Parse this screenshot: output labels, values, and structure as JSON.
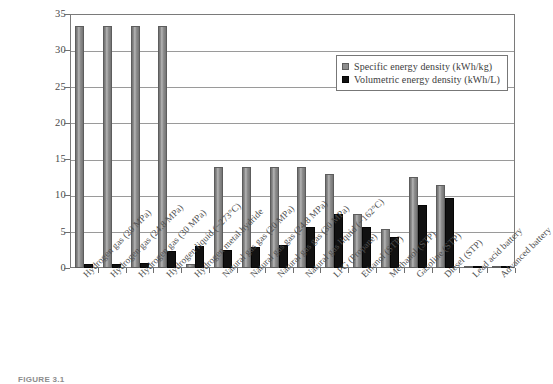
{
  "caption": "FIGURE 3.1",
  "legend": {
    "position": "top-right-inside",
    "items": [
      {
        "label": "Specific energy density (kWh/kg)",
        "color": "#8d8d8d",
        "swatch": "square-swatch-gray"
      },
      {
        "label": "Volumetric energy density (kWh/L)",
        "color": "#111111",
        "swatch": "square-swatch-black"
      }
    ]
  },
  "chart_data": {
    "type": "bar",
    "title": "",
    "xlabel": "",
    "ylabel": "",
    "ylim": [
      0,
      35
    ],
    "yticks": [
      0,
      5,
      10,
      15,
      20,
      25,
      30,
      35
    ],
    "grid": true,
    "legend_position": "upper right",
    "categories": [
      "Hydrogen gas (20 MPa)",
      "Hydrogen gas (24.8 MPa)",
      "Hydrogen gas (30 MPa)",
      "Hydrogen liquid (−273°C)",
      "Hydrogen metal hydride",
      "Natural gas gas (20 MPa)",
      "Natural gas gas (24.8 MPa)",
      "Natural gas gas (30 MPa)",
      "Natural gas liquid (−162°C)",
      "LPG (Propane)",
      "Ethanol (STP)",
      "Methanol (STP)",
      "Gasoline (STP)",
      "Diesel (STP)",
      "Lead acid battery",
      "Advanced battery"
    ],
    "series": [
      {
        "name": "Specific energy density (kWh/kg)",
        "color": "#8d8d8d",
        "values": [
          33.3,
          33.3,
          33.3,
          33.3,
          0.58,
          13.9,
          13.9,
          13.9,
          13.9,
          12.9,
          7.5,
          5.4,
          12.6,
          11.5,
          0.03,
          0.08
        ]
      },
      {
        "name": "Volumetric energy density (kWh/L)",
        "color": "#111111",
        "values": [
          0.5,
          0.6,
          0.7,
          2.4,
          3.1,
          2.5,
          2.9,
          3.2,
          5.7,
          7.4,
          5.7,
          4.3,
          8.7,
          9.6,
          0.09,
          0.14
        ]
      }
    ]
  }
}
